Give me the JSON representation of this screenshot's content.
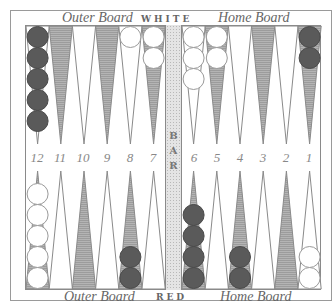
{
  "board": {
    "top_labels": {
      "outer": "Outer Board",
      "player": "WHITE",
      "home": "Home Board"
    },
    "bottom_labels": {
      "outer": "Outer Board",
      "player": "RED",
      "home": "Home Board"
    },
    "bar_label": [
      "B",
      "A",
      "R"
    ],
    "point_numbers": [
      "12",
      "11",
      "10",
      "9",
      "8",
      "7",
      "6",
      "5",
      "4",
      "3",
      "2",
      "1"
    ],
    "colors": {
      "red_checker": "#5a5a5a",
      "white_checker": "#ffffff",
      "shaded_point": "#a9a9a9",
      "plain_point": "#ffffff",
      "outline": "#8a8a8a"
    },
    "top_row": [
      {
        "number": "12",
        "shaded": false,
        "checkers": {
          "color": "red",
          "count": 5
        }
      },
      {
        "number": "11",
        "shaded": true,
        "checkers": null
      },
      {
        "number": "10",
        "shaded": false,
        "checkers": null
      },
      {
        "number": "9",
        "shaded": true,
        "checkers": null
      },
      {
        "number": "8",
        "shaded": false,
        "checkers": {
          "color": "white",
          "count": 1
        }
      },
      {
        "number": "7",
        "shaded": true,
        "checkers": {
          "color": "white",
          "count": 2
        }
      },
      {
        "number": "6",
        "shaded": false,
        "checkers": {
          "color": "white",
          "count": 3
        }
      },
      {
        "number": "5",
        "shaded": true,
        "checkers": {
          "color": "white",
          "count": 2
        }
      },
      {
        "number": "4",
        "shaded": false,
        "checkers": null
      },
      {
        "number": "3",
        "shaded": true,
        "checkers": null
      },
      {
        "number": "2",
        "shaded": false,
        "checkers": null
      },
      {
        "number": "1",
        "shaded": true,
        "checkers": {
          "color": "red",
          "count": 2
        }
      }
    ],
    "bottom_row": [
      {
        "shaded": true,
        "checkers": {
          "color": "white",
          "count": 5
        }
      },
      {
        "shaded": false,
        "checkers": null
      },
      {
        "shaded": true,
        "checkers": null
      },
      {
        "shaded": false,
        "checkers": null
      },
      {
        "shaded": true,
        "checkers": {
          "color": "red",
          "count": 2
        }
      },
      {
        "shaded": false,
        "checkers": null
      },
      {
        "shaded": true,
        "checkers": {
          "color": "red",
          "count": 4
        }
      },
      {
        "shaded": false,
        "checkers": null
      },
      {
        "shaded": true,
        "checkers": {
          "color": "red",
          "count": 2
        }
      },
      {
        "shaded": false,
        "checkers": null
      },
      {
        "shaded": true,
        "checkers": null
      },
      {
        "shaded": false,
        "checkers": {
          "color": "white",
          "count": 2
        }
      }
    ]
  }
}
